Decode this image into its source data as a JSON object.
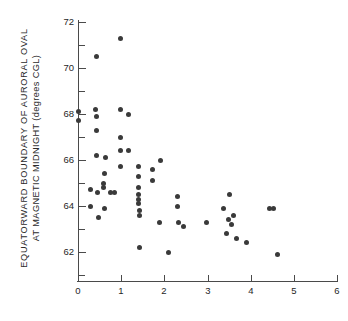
{
  "chart_data": {
    "type": "scatter",
    "title": "",
    "xlabel": "",
    "ylabel_line1": "EQUATORWARD  BOUNDARY  OF  AURORAL  OVAL",
    "ylabel_line2": "AT  MAGNETIC  MIDNIGHT  (degrees CGL)",
    "xlim": [
      0,
      6
    ],
    "ylim": [
      60,
      72
    ],
    "xticks": [
      0,
      1,
      2,
      3,
      4,
      5,
      6
    ],
    "xtick_labels": [
      "0",
      "1",
      "2",
      "3",
      "4",
      "5",
      "6"
    ],
    "yticks": [
      62,
      64,
      66,
      68,
      70,
      72
    ],
    "ytick_labels": [
      "62",
      "64",
      "66",
      "68",
      "70",
      "72"
    ],
    "y_minor_ticks": [
      61,
      63,
      65,
      67,
      69,
      71
    ],
    "grid": false,
    "legend": null,
    "marker": "filled-circle",
    "marker_color": "#3a3a3a",
    "points": [
      [
        0.99,
        71.3
      ],
      [
        0.42,
        70.5
      ],
      [
        0.0,
        68.1
      ],
      [
        0.0,
        67.7
      ],
      [
        0.41,
        68.2
      ],
      [
        0.98,
        68.2
      ],
      [
        1.16,
        68.0
      ],
      [
        0.42,
        67.9
      ],
      [
        0.43,
        67.3
      ],
      [
        0.98,
        67.0
      ],
      [
        0.98,
        66.4
      ],
      [
        1.18,
        66.4
      ],
      [
        0.44,
        66.2
      ],
      [
        0.63,
        66.1
      ],
      [
        1.9,
        66.0
      ],
      [
        0.98,
        65.7
      ],
      [
        1.41,
        65.7
      ],
      [
        1.73,
        65.6
      ],
      [
        0.62,
        65.4
      ],
      [
        1.4,
        65.3
      ],
      [
        1.72,
        65.1
      ],
      [
        0.6,
        65.0
      ],
      [
        0.59,
        64.8
      ],
      [
        1.39,
        64.8
      ],
      [
        0.28,
        64.7
      ],
      [
        0.46,
        64.6
      ],
      [
        0.76,
        64.6
      ],
      [
        0.84,
        64.6
      ],
      [
        1.4,
        64.5
      ],
      [
        1.4,
        64.3
      ],
      [
        2.3,
        64.4
      ],
      [
        1.41,
        64.1
      ],
      [
        2.31,
        64.0
      ],
      [
        0.3,
        64.0
      ],
      [
        0.62,
        63.9
      ],
      [
        1.42,
        63.8
      ],
      [
        1.43,
        63.6
      ],
      [
        0.48,
        63.5
      ],
      [
        1.88,
        63.3
      ],
      [
        2.32,
        63.3
      ],
      [
        2.44,
        63.1
      ],
      [
        3.52,
        64.5
      ],
      [
        3.38,
        63.9
      ],
      [
        3.6,
        63.6
      ],
      [
        3.48,
        63.4
      ],
      [
        3.56,
        63.2
      ],
      [
        2.98,
        63.3
      ],
      [
        3.44,
        62.8
      ],
      [
        3.67,
        62.6
      ],
      [
        3.9,
        62.4
      ],
      [
        4.44,
        63.9
      ],
      [
        4.52,
        63.9
      ],
      [
        1.43,
        62.2
      ],
      [
        2.1,
        62.0
      ],
      [
        4.62,
        61.9
      ]
    ]
  }
}
